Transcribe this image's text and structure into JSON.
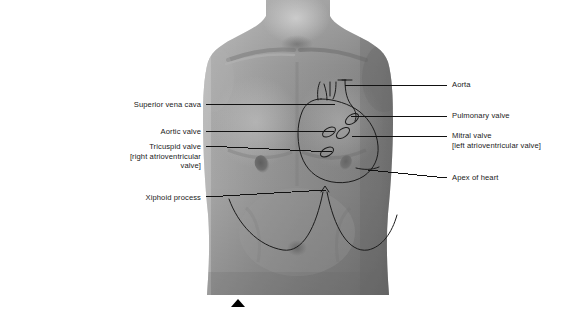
{
  "figure": {
    "kind": "surface-anatomy-photograph",
    "overlay": "heart-outline-with-valve-positions"
  },
  "colors": {
    "background": "#ffffff",
    "leader_line": "#111111",
    "overlay_line": "#1b1b1b",
    "text": "#1a1a1a",
    "marker": "#000000",
    "skin_light": "#c9c9c9",
    "skin_mid": "#9a9a9a",
    "skin_dark": "#6f6f6f",
    "skin_shadow": "#585858"
  },
  "labels_left": [
    {
      "id": "superior-vena-cava",
      "lines": [
        "Superior vena cava"
      ],
      "text_right_x": 201,
      "text_top_y": 100,
      "leader": {
        "x1": 206,
        "y1": 104,
        "x2": 335,
        "y2": 104
      }
    },
    {
      "id": "aortic-valve",
      "lines": [
        "Aortic valve"
      ],
      "text_right_x": 201,
      "text_top_y": 127,
      "leader": {
        "x1": 206,
        "y1": 131,
        "x2": 334,
        "y2": 131
      }
    },
    {
      "id": "tricuspid-valve",
      "lines": [
        "Tricuspid valve",
        "[right atrioventricular",
        "valve]"
      ],
      "text_right_x": 201,
      "text_top_y": 142,
      "leader": {
        "x1": 206,
        "y1": 146,
        "x2": 332,
        "y2": 152
      }
    },
    {
      "id": "xiphoid-process",
      "lines": [
        "Xiphoid process"
      ],
      "text_right_x": 201,
      "text_top_y": 193,
      "leader": {
        "x1": 206,
        "y1": 197,
        "x2": 326,
        "y2": 190
      }
    }
  ],
  "labels_right": [
    {
      "id": "aorta",
      "lines": [
        "Aorta"
      ],
      "text_left_x": 452,
      "text_top_y": 80,
      "leader": {
        "x1": 345,
        "y1": 85,
        "x2": 447,
        "y2": 85
      }
    },
    {
      "id": "pulmonary-valve",
      "lines": [
        "Pulmonary valve"
      ],
      "text_left_x": 452,
      "text_top_y": 111,
      "leader": {
        "x1": 351,
        "y1": 116,
        "x2": 447,
        "y2": 116
      }
    },
    {
      "id": "mitral-valve",
      "lines": [
        "Mitral valve",
        "[left atrioventricular valve]"
      ],
      "text_left_x": 452,
      "text_top_y": 131,
      "leader": {
        "x1": 352,
        "y1": 136,
        "x2": 447,
        "y2": 136
      }
    },
    {
      "id": "apex-of-heart",
      "lines": [
        "Apex of heart"
      ],
      "text_left_x": 452,
      "text_top_y": 173,
      "leader": {
        "x1": 368,
        "y1": 170,
        "x2": 447,
        "y2": 178
      }
    }
  ],
  "marker": {
    "id": "bottom-center-triangle",
    "x": 231,
    "y": 299
  }
}
